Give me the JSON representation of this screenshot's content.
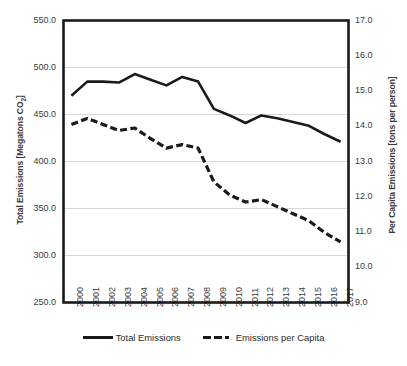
{
  "chart_data": {
    "type": "line",
    "title": "",
    "xlabel": "",
    "ylabel": "Total Emissions  [Megatons CO2]",
    "y2label": "Per Capita Emissions [tons per person]",
    "grid": true,
    "legend_position": "bottom",
    "categories": [
      "2000",
      "2001",
      "2002",
      "2003",
      "2004",
      "2005",
      "2006",
      "2007",
      "2008",
      "2009",
      "2010",
      "2011",
      "2012",
      "2013",
      "2014",
      "2015",
      "2016",
      "2017"
    ],
    "ylim": [
      250.0,
      550.0
    ],
    "y2lim": [
      9.0,
      17.0
    ],
    "yticks": [
      "550.0",
      "500.0",
      "450.0",
      "400.0",
      "350.0",
      "300.0",
      "250.0"
    ],
    "y2ticks": [
      "17.0",
      "16.0",
      "15.0",
      "14.0",
      "13.0",
      "12.0",
      "11.0",
      "10.0",
      "9.0"
    ],
    "ytick_values": [
      550.0,
      500.0,
      450.0,
      400.0,
      350.0,
      300.0,
      250.0
    ],
    "y2tick_values": [
      17.0,
      16.0,
      15.0,
      14.0,
      13.0,
      12.0,
      11.0,
      10.0,
      9.0
    ],
    "series": [
      {
        "name": "Total Emissions",
        "axis": "left",
        "style": "solid",
        "color": "#1a1a1a",
        "values": [
          470,
          485,
          485,
          484,
          493,
          487,
          481,
          490,
          485,
          456,
          449,
          441,
          449,
          446,
          442,
          438,
          429,
          421
        ]
      },
      {
        "name": "Emissions per Capita",
        "axis": "right",
        "style": "dashed",
        "color": "#1a1a1a",
        "values": [
          14.05,
          14.22,
          14.05,
          13.88,
          13.95,
          13.65,
          13.38,
          13.48,
          13.38,
          12.42,
          12.05,
          11.85,
          11.92,
          11.72,
          11.52,
          11.32,
          10.98,
          10.72
        ]
      }
    ]
  },
  "legend": {
    "items": [
      {
        "label": "Total Emissions",
        "style": "solid"
      },
      {
        "label": "Emissions per Capita",
        "style": "dashed"
      }
    ]
  },
  "axes": {
    "left_title_main": "Total Emissions  [Megatons CO",
    "left_title_sub": "2",
    "left_title_end": "]",
    "right_title": "Per Capita Emissions [tons per person]"
  },
  "colors": {
    "line": "#1a1a1a",
    "frame": "#1a1a1a",
    "grid": "#d9d9d9",
    "text": "#3a3a3a",
    "background": "#ffffff"
  }
}
